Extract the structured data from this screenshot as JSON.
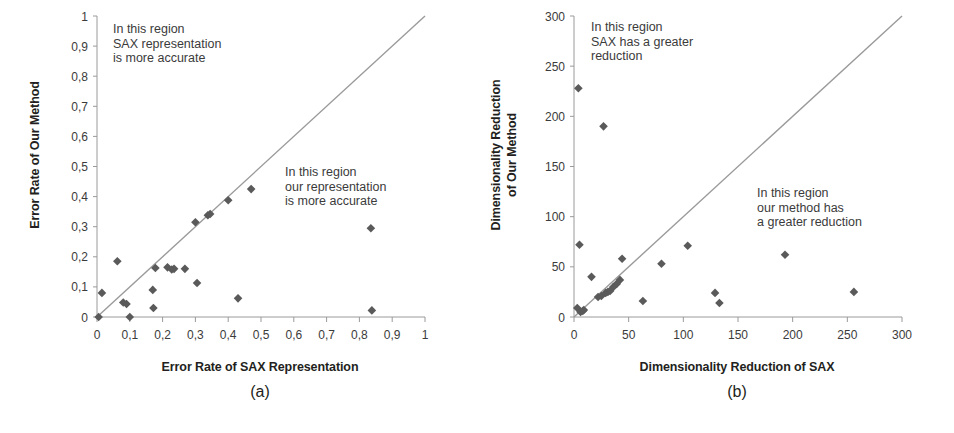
{
  "figure": {
    "background": "#ffffff",
    "marker_color": "#5a5a5a",
    "line_color": "#9a9a9a",
    "axis_color": "#9a9a9a",
    "text_color": "#3b3b3b"
  },
  "panels": [
    {
      "id": "a",
      "caption": "(a)",
      "xlabel": "Error Rate of SAX Representation",
      "ylabel": "Error Rate of Our Method",
      "ylabel_lines": [
        "Error Rate of Our Method"
      ],
      "annotation_upper": "In this region\nSAX representation\nis more accurate",
      "annotation_lower": "In this region\nour representation\nis more accurate",
      "xticks": [
        "0",
        "0,1",
        "0,2",
        "0,3",
        "0,4",
        "0,5",
        "0,6",
        "0,7",
        "0,8",
        "0,9",
        "1"
      ],
      "yticks": [
        "0",
        "0,1",
        "0,2",
        "0,3",
        "0,4",
        "0,5",
        "0,6",
        "0,7",
        "0,8",
        "0,9",
        "1"
      ]
    },
    {
      "id": "b",
      "caption": "(b)",
      "xlabel": "Dimensionality Reduction of SAX",
      "ylabel": "Dimensionality Reduction of Our Method",
      "ylabel_lines": [
        "Dimensionality Reduction",
        "of Our Method"
      ],
      "annotation_upper": "In this region\nSAX has a greater\nreduction",
      "annotation_lower": "In this region\nour method has\na greater reduction",
      "xticks": [
        "0",
        "50",
        "100",
        "150",
        "200",
        "250",
        "300"
      ],
      "yticks": [
        "0",
        "50",
        "100",
        "150",
        "200",
        "250",
        "300"
      ]
    }
  ],
  "chart_data": [
    {
      "type": "scatter",
      "panel": "a",
      "title": "(a)",
      "xlabel": "Error Rate of SAX Representation",
      "ylabel": "Error Rate of Our Method",
      "xlim": [
        0,
        1
      ],
      "ylim": [
        0,
        1
      ],
      "xticks": [
        0,
        0.1,
        0.2,
        0.3,
        0.4,
        0.5,
        0.6,
        0.7,
        0.8,
        0.9,
        1
      ],
      "yticks": [
        0,
        0.1,
        0.2,
        0.3,
        0.4,
        0.5,
        0.6,
        0.7,
        0.8,
        0.9,
        1
      ],
      "grid": false,
      "legend": "none",
      "reference_line": {
        "type": "identity",
        "from": [
          0,
          0
        ],
        "to": [
          1,
          1
        ]
      },
      "annotations": [
        {
          "text": "In this region\nSAX representation\nis more accurate",
          "x": 0.06,
          "y": 0.97
        },
        {
          "text": "In this region\nour representation\nis more accurate",
          "x": 0.6,
          "y": 0.5
        }
      ],
      "points": [
        {
          "x": 0.005,
          "y": 0.0
        },
        {
          "x": 0.015,
          "y": 0.08
        },
        {
          "x": 0.062,
          "y": 0.185
        },
        {
          "x": 0.08,
          "y": 0.048
        },
        {
          "x": 0.09,
          "y": 0.043
        },
        {
          "x": 0.1,
          "y": 0.0
        },
        {
          "x": 0.17,
          "y": 0.09
        },
        {
          "x": 0.172,
          "y": 0.03
        },
        {
          "x": 0.178,
          "y": 0.163
        },
        {
          "x": 0.215,
          "y": 0.165
        },
        {
          "x": 0.228,
          "y": 0.158
        },
        {
          "x": 0.235,
          "y": 0.16
        },
        {
          "x": 0.268,
          "y": 0.16
        },
        {
          "x": 0.3,
          "y": 0.315
        },
        {
          "x": 0.305,
          "y": 0.113
        },
        {
          "x": 0.338,
          "y": 0.338
        },
        {
          "x": 0.345,
          "y": 0.342
        },
        {
          "x": 0.4,
          "y": 0.388
        },
        {
          "x": 0.43,
          "y": 0.062
        },
        {
          "x": 0.47,
          "y": 0.425
        },
        {
          "x": 0.835,
          "y": 0.295
        },
        {
          "x": 0.838,
          "y": 0.022
        }
      ]
    },
    {
      "type": "scatter",
      "panel": "b",
      "title": "(b)",
      "xlabel": "Dimensionality Reduction of SAX",
      "ylabel": "Dimensionality Reduction of Our Method",
      "xlim": [
        0,
        300
      ],
      "ylim": [
        0,
        300
      ],
      "xticks": [
        0,
        50,
        100,
        150,
        200,
        250,
        300
      ],
      "yticks": [
        0,
        50,
        100,
        150,
        200,
        250,
        300
      ],
      "grid": false,
      "legend": "none",
      "reference_line": {
        "type": "identity",
        "from": [
          0,
          0
        ],
        "to": [
          300,
          300
        ]
      },
      "annotations": [
        {
          "text": "In this region\nSAX has a greater\nreduction",
          "x": 13,
          "y": 295
        },
        {
          "text": "In this region\nour method has\na greater reduction",
          "x": 168,
          "y": 145
        }
      ],
      "points": [
        {
          "x": 4,
          "y": 228
        },
        {
          "x": 27,
          "y": 190
        },
        {
          "x": 5,
          "y": 72
        },
        {
          "x": 16,
          "y": 40
        },
        {
          "x": 44,
          "y": 58
        },
        {
          "x": 80,
          "y": 53
        },
        {
          "x": 104,
          "y": 71
        },
        {
          "x": 193,
          "y": 62
        },
        {
          "x": 3,
          "y": 9
        },
        {
          "x": 6,
          "y": 5
        },
        {
          "x": 8,
          "y": 6
        },
        {
          "x": 9,
          "y": 7
        },
        {
          "x": 22,
          "y": 20
        },
        {
          "x": 25,
          "y": 21
        },
        {
          "x": 29,
          "y": 24
        },
        {
          "x": 31,
          "y": 25
        },
        {
          "x": 33,
          "y": 26
        },
        {
          "x": 36,
          "y": 30
        },
        {
          "x": 39,
          "y": 33
        },
        {
          "x": 42,
          "y": 37
        },
        {
          "x": 63,
          "y": 16
        },
        {
          "x": 129,
          "y": 24
        },
        {
          "x": 133,
          "y": 14
        },
        {
          "x": 256,
          "y": 25
        }
      ]
    }
  ]
}
